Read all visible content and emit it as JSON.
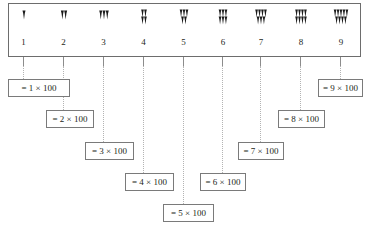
{
  "figure": {
    "multiplier": 100
  },
  "numerals": [
    {
      "value": 1,
      "label": "1",
      "glyph_name": "cuneiform-one",
      "wedges_top": 1,
      "wedges_bottom": 0,
      "equation": "= 1 × 100"
    },
    {
      "value": 2,
      "label": "2",
      "glyph_name": "cuneiform-two",
      "wedges_top": 2,
      "wedges_bottom": 0,
      "equation": "= 2 × 100"
    },
    {
      "value": 3,
      "label": "3",
      "glyph_name": "cuneiform-three",
      "wedges_top": 3,
      "wedges_bottom": 0,
      "equation": "= 3 × 100"
    },
    {
      "value": 4,
      "label": "4",
      "glyph_name": "cuneiform-four",
      "wedges_top": 2,
      "wedges_bottom": 2,
      "equation": "= 4 × 100"
    },
    {
      "value": 5,
      "label": "5",
      "glyph_name": "cuneiform-five",
      "wedges_top": 3,
      "wedges_bottom": 2,
      "equation": "= 5 × 100"
    },
    {
      "value": 6,
      "label": "6",
      "glyph_name": "cuneiform-six",
      "wedges_top": 3,
      "wedges_bottom": 3,
      "equation": "= 6 × 100"
    },
    {
      "value": 7,
      "label": "7",
      "glyph_name": "cuneiform-seven",
      "wedges_top": 4,
      "wedges_bottom": 3,
      "equation": "= 7 × 100"
    },
    {
      "value": 8,
      "label": "8",
      "glyph_name": "cuneiform-eight",
      "wedges_top": 4,
      "wedges_bottom": 4,
      "equation": "= 8 × 100"
    },
    {
      "value": 9,
      "label": "9",
      "glyph_name": "cuneiform-nine",
      "wedges_top": 5,
      "wedges_bottom": 4,
      "equation": "= 9 × 100"
    }
  ],
  "colors": {
    "ink": "#231f20",
    "box_border": "#6d6d6d",
    "eq_border": "#7a7a7a",
    "tick": "#8c8c8c",
    "dotted": "#b3b3b3",
    "background": "#ffffff"
  }
}
